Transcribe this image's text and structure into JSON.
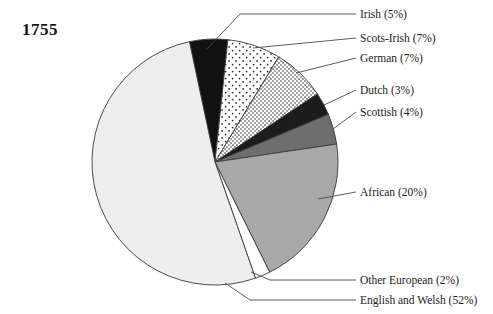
{
  "title": "1755",
  "chart_data": {
    "type": "pie",
    "title": "1755",
    "xlabel": "",
    "ylabel": "",
    "units": "percent",
    "start_angle_deg": -12,
    "direction": "clockwise",
    "legend_position": "callout-labels-right",
    "grid": false,
    "categories": [
      "Irish",
      "Scots-Irish",
      "German",
      "Dutch",
      "Scottish",
      "African",
      "Other European",
      "English and Welsh"
    ],
    "values": [
      5,
      7,
      7,
      3,
      4,
      20,
      2,
      52
    ],
    "labels": [
      "Irish (5%)",
      "Scots-Irish (7%)",
      "German (7%)",
      "Dutch (3%)",
      "Scottish (4%)",
      "African (20%)",
      "Other European (2%)",
      "English and Welsh (52%)"
    ],
    "slice_styles": [
      "solid-black",
      "sparse-dots",
      "dense-dots",
      "near-black",
      "dark-gray",
      "medium-gray",
      "white",
      "very-light-gray"
    ],
    "colors": [
      "#111111",
      "#ffffff",
      "#ffffff",
      "#1c1c1c",
      "#6e6e6e",
      "#a8a8a8",
      "#ffffff",
      "#eeeeee"
    ],
    "stroke_color": "#3a3a3a"
  },
  "slices": [
    {
      "label": "Irish (5%)",
      "name": "Irish",
      "value": 5
    },
    {
      "label": "Scots-Irish (7%)",
      "name": "Scots-Irish",
      "value": 7
    },
    {
      "label": "German (7%)",
      "name": "German",
      "value": 7
    },
    {
      "label": "Dutch (3%)",
      "name": "Dutch",
      "value": 3
    },
    {
      "label": "Scottish (4%)",
      "name": "Scottish",
      "value": 4
    },
    {
      "label": "African (20%)",
      "name": "African",
      "value": 20
    },
    {
      "label": "Other European (2%)",
      "name": "Other European",
      "value": 2
    },
    {
      "label": "English and Welsh (52%)",
      "name": "English and Welsh",
      "value": 52
    }
  ]
}
